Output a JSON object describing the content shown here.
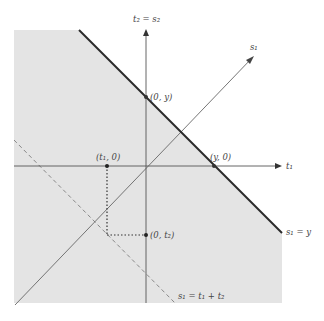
{
  "diagram": {
    "title": "",
    "colors": {
      "region_fill": "#e4e4e4",
      "axis": "#555555",
      "boundary": "#2a2a2a",
      "dashed": "#777777",
      "dotted": "#333333",
      "text": "#444444"
    },
    "axes": {
      "t1_label": "t₁",
      "t2_label": "t₂ = s₂",
      "s1_label": "s₁"
    },
    "points": {
      "zero_y": "(0, y)",
      "y_zero": "(y, 0)",
      "t1_zero": "(t₁, 0)",
      "zero_t2": "(0, t₂)"
    },
    "lines": {
      "boundary_label": "s₁ = y",
      "dashed_label": "s₁ = t₁ + t₂"
    }
  }
}
